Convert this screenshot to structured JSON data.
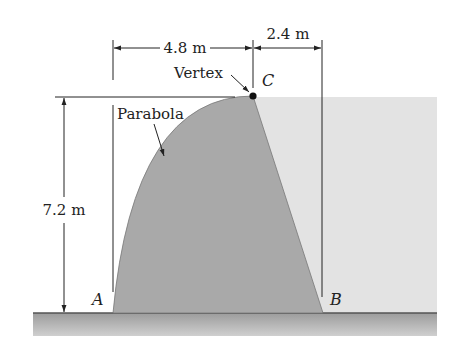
{
  "figure": {
    "type": "parabolic-dam-cross-section",
    "labels": {
      "dim_horizontal_left": "4.8 m",
      "dim_horizontal_right": "2.4 m",
      "dim_vertical": "7.2 m",
      "vertex": "Vertex",
      "parabola": "Parabola",
      "point_a": "A",
      "point_b": "B",
      "point_c": "C"
    },
    "dimensions": {
      "width_a_to_c_m": 4.8,
      "width_c_to_b_m": 2.4,
      "height_m": 7.2
    },
    "colors": {
      "dam_fill": "#a9a9a9",
      "water_fill": "#e3e3e3",
      "ground_fill": "#b5b5b5",
      "line": "#222222",
      "background": "#ffffff"
    }
  }
}
